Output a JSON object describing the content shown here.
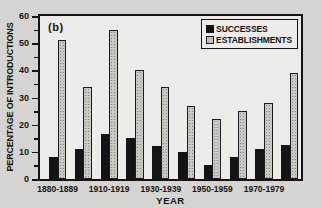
{
  "figure": {
    "panel_label": "(b)",
    "background_color": "#d6d4d0",
    "plot_background_color": "#edebe7",
    "ink_color": "#141414"
  },
  "chart_data": {
    "type": "bar",
    "title": "",
    "xlabel": "YEAR",
    "ylabel": "PERCENTAGE OF INTRODUCTIONS",
    "ylim": [
      0,
      60
    ],
    "y_major_ticks": [
      0,
      10,
      20,
      30,
      40,
      50,
      60
    ],
    "y_minor_tick_step": 5,
    "grid": false,
    "legend_position": "top-right",
    "categories": [
      "1880-1889",
      "",
      "1910-1919",
      "",
      "1930-1939",
      "",
      "1950-1959",
      "",
      "1970-1979",
      ""
    ],
    "x_tick_labels_visible": [
      "1880-1889",
      "1910-1919",
      "1930-1939",
      "1950-1959",
      "1970-1979"
    ],
    "series": [
      {
        "name": "SUCCESSES",
        "color": "#141414",
        "values": [
          8,
          11,
          16.5,
          15,
          12,
          10,
          5,
          8,
          11,
          12.5
        ]
      },
      {
        "name": "ESTABLISHMENTS",
        "color": "#c9c7c1",
        "values": [
          51,
          34,
          55,
          40,
          34,
          27,
          22,
          25,
          28,
          39
        ]
      }
    ]
  },
  "legend": {
    "items": [
      {
        "label": "SUCCESSES",
        "swatch": "black-filled-square"
      },
      {
        "label": "ESTABLISHMENTS",
        "swatch": "gray-stippled-square"
      }
    ]
  }
}
